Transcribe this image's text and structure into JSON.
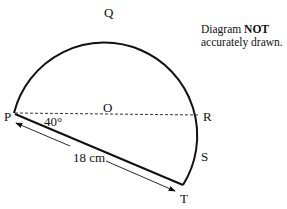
{
  "figure": {
    "note_line1_prefix": "Diagram ",
    "note_line1_bold": "NOT",
    "note_line2": "accurately drawn.",
    "points": {
      "P": "P",
      "Q": "Q",
      "O": "O",
      "R": "R",
      "S": "S",
      "T": "T"
    },
    "angle_label": "40°",
    "length_label": "18 cm",
    "shapes": {
      "arc": "major arc P-Q-R-S-T of circle centre O",
      "diameter": "dashed segment PR through O",
      "chord": "solid segment PT",
      "dimension": "double-headed arrow parallel to PT"
    }
  }
}
